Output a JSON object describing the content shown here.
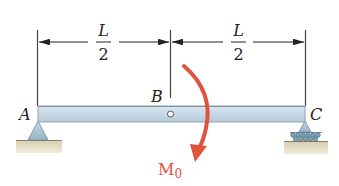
{
  "diagram": {
    "type": "beam-diagram",
    "dimensions": [
      {
        "numerator": "L",
        "denominator": "2",
        "from": "A",
        "to": "B"
      },
      {
        "numerator": "L",
        "denominator": "2",
        "from": "B",
        "to": "C"
      }
    ],
    "points": {
      "A": "A",
      "B": "B",
      "C": "C"
    },
    "supports": {
      "A": "pin",
      "C": "roller"
    },
    "load": {
      "label_main": "M",
      "label_sub": "0",
      "type": "moment",
      "direction": "clockwise",
      "applied_at": "B"
    },
    "colors": {
      "beam_fill": "#c9dbe6",
      "beam_stroke": "#8fa3b1",
      "moment": "#e0533e",
      "ground": "#e6dcc2",
      "support": "#a9c4d6",
      "lines": "#333333"
    }
  }
}
